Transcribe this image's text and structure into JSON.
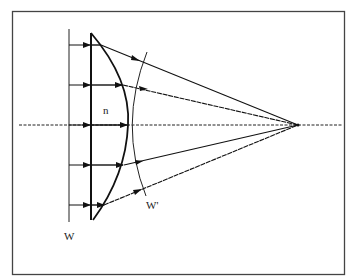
{
  "diagram": {
    "type": "optics-ray-diagram",
    "labels": {
      "incident_wavefront": "W",
      "refractive_index": "n",
      "emergent_wavefront": "W'"
    },
    "rays": [
      {
        "y": 45,
        "lens_exit_x": 101
      },
      {
        "y": 85,
        "lens_exit_x": 123
      },
      {
        "y": 125,
        "lens_exit_x": 128
      },
      {
        "y": 165,
        "lens_exit_x": 124
      },
      {
        "y": 205,
        "lens_exit_x": 104
      }
    ],
    "focal_point": {
      "x": 298,
      "y": 125
    },
    "colors": {
      "line": "#1a1a1a",
      "frame": "#444444",
      "background": "#ffffff"
    }
  }
}
